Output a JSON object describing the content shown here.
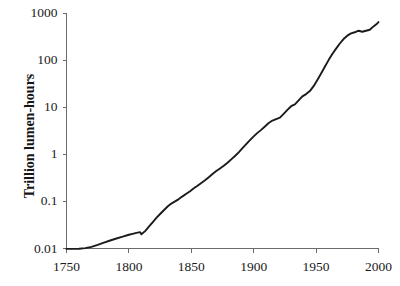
{
  "chart_data": {
    "type": "line",
    "title": "",
    "xlabel": "",
    "ylabel": "Trillion lumen-hours",
    "yscale": "log",
    "xlim": [
      1750,
      2000
    ],
    "ylim": [
      0.01,
      1000
    ],
    "grid": false,
    "legend": null,
    "xticks": [
      1750,
      1800,
      1850,
      1900,
      1950,
      2000
    ],
    "xtick_labels": [
      "1750",
      "1800",
      "1850",
      "1900",
      "1950",
      "2000"
    ],
    "yticks": [
      0.01,
      0.1,
      1,
      10,
      100,
      1000
    ],
    "ytick_labels": [
      "0.01",
      "0.1",
      "1",
      "10",
      "100",
      "1000"
    ],
    "series": [
      {
        "name": "UK lighting consumption",
        "color": "#1b1b1b",
        "x": [
          1750,
          1755,
          1760,
          1765,
          1770,
          1775,
          1780,
          1785,
          1790,
          1795,
          1800,
          1803,
          1806,
          1809,
          1810,
          1813,
          1816,
          1819,
          1822,
          1825,
          1828,
          1831,
          1834,
          1837,
          1840,
          1843,
          1846,
          1849,
          1852,
          1855,
          1858,
          1861,
          1864,
          1867,
          1870,
          1873,
          1876,
          1879,
          1882,
          1885,
          1888,
          1891,
          1894,
          1897,
          1900,
          1903,
          1906,
          1909,
          1912,
          1915,
          1918,
          1921,
          1924,
          1927,
          1930,
          1933,
          1936,
          1939,
          1942,
          1945,
          1948,
          1951,
          1954,
          1957,
          1960,
          1963,
          1966,
          1969,
          1972,
          1975,
          1978,
          1981,
          1984,
          1987,
          1990,
          1993,
          1996,
          1999,
          2000
        ],
        "y": [
          0.0098,
          0.0098,
          0.0099,
          0.0102,
          0.0108,
          0.0119,
          0.0133,
          0.0148,
          0.0163,
          0.0178,
          0.0196,
          0.0205,
          0.0214,
          0.0222,
          0.02,
          0.0234,
          0.029,
          0.036,
          0.0445,
          0.054,
          0.065,
          0.078,
          0.09,
          0.1,
          0.112,
          0.128,
          0.145,
          0.165,
          0.19,
          0.215,
          0.245,
          0.28,
          0.325,
          0.38,
          0.44,
          0.5,
          0.57,
          0.66,
          0.78,
          0.92,
          1.1,
          1.35,
          1.65,
          2.0,
          2.4,
          2.85,
          3.3,
          3.9,
          4.6,
          5.2,
          5.6,
          6.0,
          7.2,
          8.8,
          10.5,
          11.5,
          14.0,
          17.0,
          19.0,
          22.0,
          28.0,
          38.0,
          52.0,
          72.0,
          100.0,
          135.0,
          175.0,
          225.0,
          280.0,
          330.0,
          370.0,
          390.0,
          420.0,
          400.0,
          420.0,
          440.0,
          520.0,
          600.0,
          640.0
        ]
      }
    ]
  },
  "figure": {
    "y_axis_title": "Trillion lumen-hours",
    "footer_fragment": ""
  }
}
